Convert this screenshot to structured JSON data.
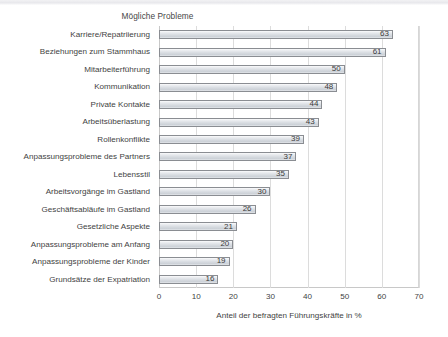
{
  "chart_data": {
    "type": "bar",
    "orientation": "horizontal",
    "title": "Mögliche Probleme",
    "xlabel": "Anteil der befragten Führungskräfte in %",
    "ylabel": "",
    "xlim": [
      0,
      70
    ],
    "xticks": [
      0,
      10,
      20,
      30,
      40,
      50,
      60,
      70
    ],
    "grid": true,
    "legend": null,
    "show_values": true,
    "categories": [
      "Karriere/Repatriierung",
      "Beziehungen zum Stammhaus",
      "Mitarbeiterführung",
      "Kommunikation",
      "Private Kontakte",
      "Arbeitsüberlastung",
      "Rollenkonflikte",
      "Anpassungsprobleme des Partners",
      "Lebensstil",
      "Arbeitsvorgänge im Gastland",
      "Geschäftsabläufe im Gastland",
      "Gesetzliche Aspekte",
      "Anpassungsprobleme am Anfang",
      "Anpassungsprobleme der Kinder",
      "Grundsätze der Expatriation"
    ],
    "values": [
      63,
      61,
      50,
      48,
      44,
      43,
      39,
      37,
      35,
      30,
      26,
      21,
      20,
      19,
      16
    ],
    "colors": {
      "bar_fill": "#d9dde2",
      "bar_border": "#8a8d92",
      "grid": "#dcdcdc",
      "text": "#3f3f3f",
      "background": "#ffffff"
    }
  }
}
